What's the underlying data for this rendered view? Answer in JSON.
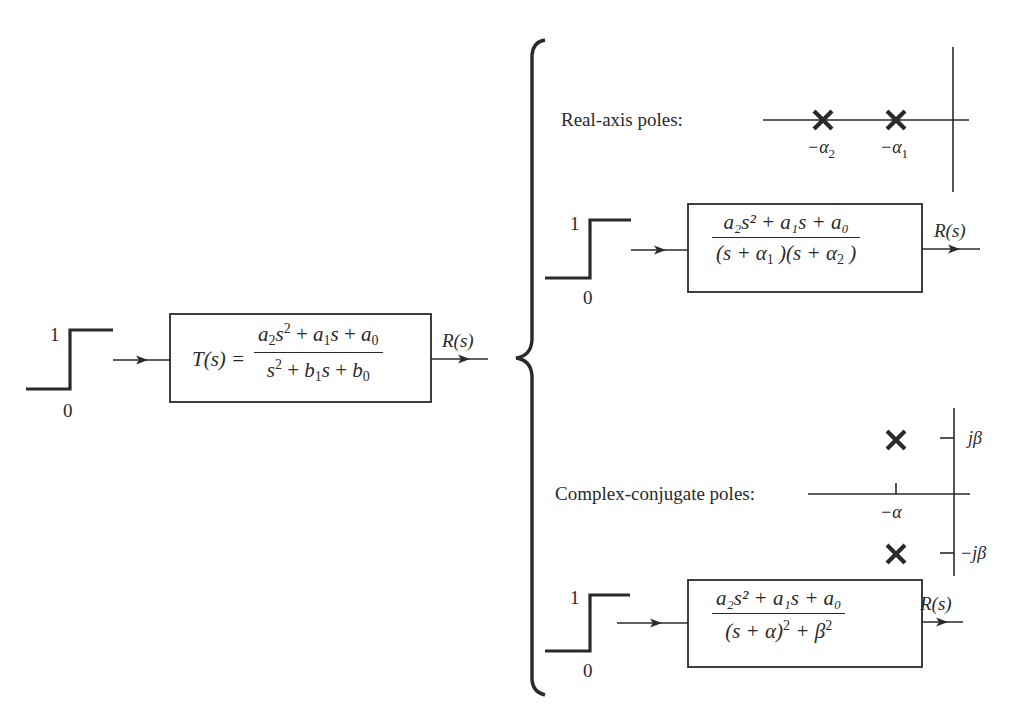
{
  "colors": {
    "ink": "#2a2a2a",
    "background": "#ffffff"
  },
  "input_signal": {
    "type": "unit-step",
    "high_label": "1",
    "low_label": "0"
  },
  "main_system": {
    "lhs": "T(s) =",
    "numerator": {
      "a2": "a",
      "a2_sub": "2",
      "s_sq": "s",
      "sq": "2",
      "plus1": " + ",
      "a1": "a",
      "a1_sub": "1",
      "s": "s",
      "plus2": " + ",
      "a0": "a",
      "a0_sub": "0"
    },
    "denominator": {
      "s": "s",
      "sq": "2",
      "plus1": " + ",
      "b1": "b",
      "b1_sub": "1",
      "s2": "s",
      "plus2": " + ",
      "b0": "b",
      "b0_sub": "0"
    },
    "output_label": "R(s)"
  },
  "real_axis_case": {
    "caption": "Real-axis poles:",
    "poles": [
      {
        "label": "−α",
        "sub": "2"
      },
      {
        "label": "−α",
        "sub": "1"
      }
    ],
    "system": {
      "numerator": "a₂s² + a₁s + a₀",
      "denominator": {
        "p1": "(s + α",
        "p1_sub": "1",
        "p1_close": " )(s + α",
        "p2_sub": "2",
        "p2_close": " )"
      },
      "output_label": "R(s)"
    },
    "step": {
      "high_label": "1",
      "low_label": "0"
    }
  },
  "complex_case": {
    "caption": "Complex-conjugate poles:",
    "real_tick_label": "−α",
    "imag_tick_labels": {
      "upper": "jβ",
      "lower": "−jβ"
    },
    "system": {
      "numerator": "a₂s² + a₁s + a₀",
      "denominator": {
        "left": "(s + α)",
        "sq1": "2",
        "mid": " + β",
        "sq2": "2"
      },
      "output_label": "R(s)"
    },
    "step": {
      "high_label": "1",
      "low_label": "0"
    }
  }
}
